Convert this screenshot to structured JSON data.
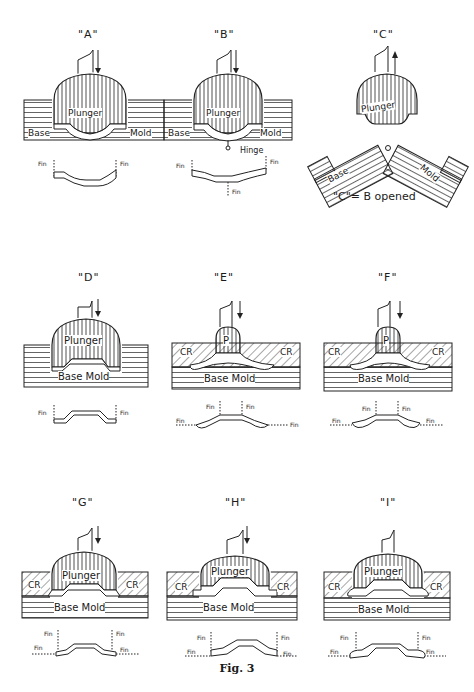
{
  "figure": {
    "caption": "Fig. 3",
    "panels": [
      {
        "id": "A",
        "title": "\"A\"",
        "plunger": "Plunger",
        "left_label": "Base",
        "right_label": "Mold",
        "fins": [
          "Fin",
          "Fin"
        ],
        "arrow": "down"
      },
      {
        "id": "B",
        "title": "\"B\"",
        "plunger": "Plunger",
        "left_label": "Base",
        "right_label": "Mold",
        "hinge": "Hinge",
        "fins": [
          "Fin",
          "Fin",
          "Fin"
        ],
        "arrow": "down"
      },
      {
        "id": "C",
        "title": "\"C\"",
        "plunger": "Plunger",
        "left_label": "Base",
        "right_label": "Mold",
        "note": "\"C\"= B opened",
        "arrow": "up"
      },
      {
        "id": "D",
        "title": "\"D\"",
        "plunger": "Plunger",
        "base_label": "Base Mold",
        "fins": [
          "Fin",
          "Fin"
        ],
        "arrow": "down"
      },
      {
        "id": "E",
        "title": "\"E\"",
        "plunger": "P",
        "left_label": "CR",
        "right_label": "CR",
        "base_label": "Base Mold",
        "fins": [
          "Fin",
          "Fin",
          "Fin",
          "Fin"
        ],
        "arrow": "down"
      },
      {
        "id": "F",
        "title": "\"F\"",
        "plunger": "P",
        "left_label": "CR",
        "right_label": "CR",
        "base_label": "Base Mold",
        "fins": [
          "Fin",
          "Fin",
          "Fin",
          "Fin"
        ],
        "arrow": "down"
      },
      {
        "id": "G",
        "title": "\"G\"",
        "plunger": "Plunger",
        "left_label": "CR",
        "right_label": "CR",
        "base_label": "Base Mold",
        "fins": [
          "Fin",
          "Fin",
          "Fin",
          "Fin"
        ],
        "arrow": "down"
      },
      {
        "id": "H",
        "title": "\"H\"",
        "plunger": "Plunger",
        "left_label": "CR",
        "right_label": "CR",
        "base_label": "Base Mold",
        "fins": [
          "Fin",
          "Fin",
          "Fin",
          "Fin"
        ],
        "arrow": "down"
      },
      {
        "id": "I",
        "title": "\"I\"",
        "plunger": "Plunger",
        "left_label": "CR",
        "right_label": "CR",
        "base_label": "Base Mold",
        "fins": [
          "Fin",
          "Fin",
          "Fin",
          "Fin"
        ],
        "arrow": "none"
      }
    ]
  }
}
